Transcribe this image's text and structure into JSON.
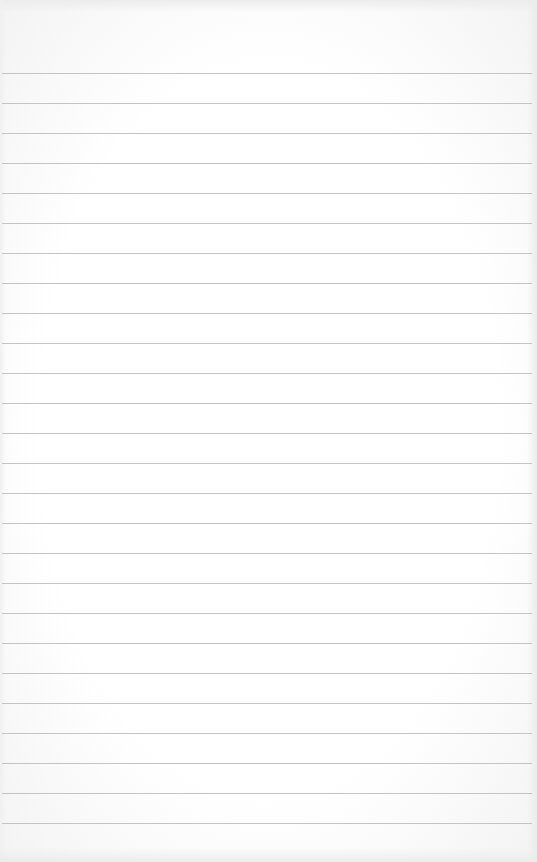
{
  "paper": {
    "kind": "ruled-paper",
    "line_color": "#c4c4c4",
    "background": "#fdfdfd",
    "first_line_y": 73,
    "line_spacing": 30,
    "line_count": 26
  }
}
